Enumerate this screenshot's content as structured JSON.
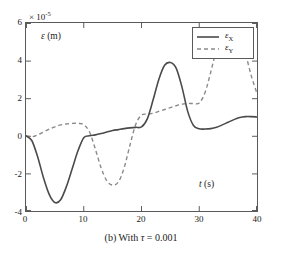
{
  "figure": {
    "caption_prefix": "(b) With ",
    "caption_symbol": "τ",
    "caption_value": " = 0.001",
    "caption_full": "(b) With τ = 0.001",
    "exponent_label": "× 10",
    "exponent_power": "-5"
  },
  "axes": {
    "ylabel_symbol": "ε",
    "ylabel_unit": " (m)",
    "xlabel_symbol": "t",
    "xlabel_unit": " (s)",
    "xticks": [
      "0",
      "10",
      "20",
      "30",
      "40"
    ],
    "yticks": [
      "6",
      "4",
      "2",
      "0",
      "-2",
      "-4"
    ]
  },
  "legend": {
    "entries": [
      {
        "symbol": "ε",
        "sub": "X",
        "style": "solid"
      },
      {
        "symbol": "ε",
        "sub": "Y",
        "style": "dashed"
      }
    ]
  },
  "colors": {
    "series_x": "#4a4a4a",
    "series_y": "#8a8a8a",
    "frame": "#5a5a5a",
    "background": "#ffffff",
    "text": "#1a1a1a"
  },
  "chart_data": {
    "type": "line",
    "title": "(b) With τ = 0.001",
    "xlabel": "t (s)",
    "ylabel": "ε (m)",
    "y_scale_exponent": -5,
    "xlim": [
      0,
      40
    ],
    "ylim": [
      -4,
      6
    ],
    "xticks": [
      0,
      10,
      20,
      30,
      40
    ],
    "yticks": [
      -4,
      -2,
      0,
      2,
      4,
      6
    ],
    "grid": false,
    "legend_position": "upper right",
    "series": [
      {
        "name": "εX",
        "style": "solid",
        "color": "#4a4a4a",
        "x": [
          0,
          1,
          2,
          3,
          4,
          5,
          6,
          7,
          8,
          9,
          10,
          11,
          12,
          13,
          14,
          15,
          16,
          17,
          18,
          19,
          20,
          21,
          22,
          23,
          24,
          25,
          26,
          27,
          28,
          29,
          30,
          31,
          32,
          33,
          34,
          35,
          36,
          37,
          38,
          39,
          40
        ],
        "y": [
          0.0,
          -0.25,
          -1.1,
          -2.2,
          -3.1,
          -3.55,
          -3.4,
          -2.7,
          -1.75,
          -0.8,
          -0.1,
          0.0,
          0.05,
          0.12,
          0.2,
          0.28,
          0.33,
          0.38,
          0.42,
          0.45,
          0.47,
          0.9,
          1.9,
          3.0,
          3.75,
          3.9,
          3.6,
          2.6,
          1.3,
          0.55,
          0.37,
          0.36,
          0.38,
          0.45,
          0.58,
          0.72,
          0.86,
          0.97,
          1.02,
          1.02,
          1.0
        ]
      },
      {
        "name": "εY",
        "style": "dashed",
        "color": "#8a8a8a",
        "x": [
          0,
          1,
          2,
          3,
          4,
          5,
          6,
          7,
          8,
          9,
          10,
          11,
          12,
          13,
          14,
          15,
          16,
          17,
          18,
          19,
          20,
          21,
          22,
          23,
          24,
          25,
          26,
          27,
          28,
          29,
          30,
          31,
          32,
          33,
          34,
          35,
          36,
          37,
          38,
          39,
          40
        ],
        "y": [
          0.0,
          -0.05,
          0.05,
          0.2,
          0.35,
          0.48,
          0.58,
          0.63,
          0.66,
          0.66,
          0.6,
          0.2,
          -0.7,
          -1.7,
          -2.4,
          -2.62,
          -2.45,
          -1.7,
          -0.5,
          0.6,
          1.1,
          1.15,
          1.2,
          1.3,
          1.4,
          1.5,
          1.6,
          1.68,
          1.72,
          1.72,
          1.75,
          2.3,
          3.4,
          4.6,
          5.3,
          5.6,
          5.65,
          5.4,
          4.4,
          3.2,
          2.25
        ]
      }
    ]
  }
}
